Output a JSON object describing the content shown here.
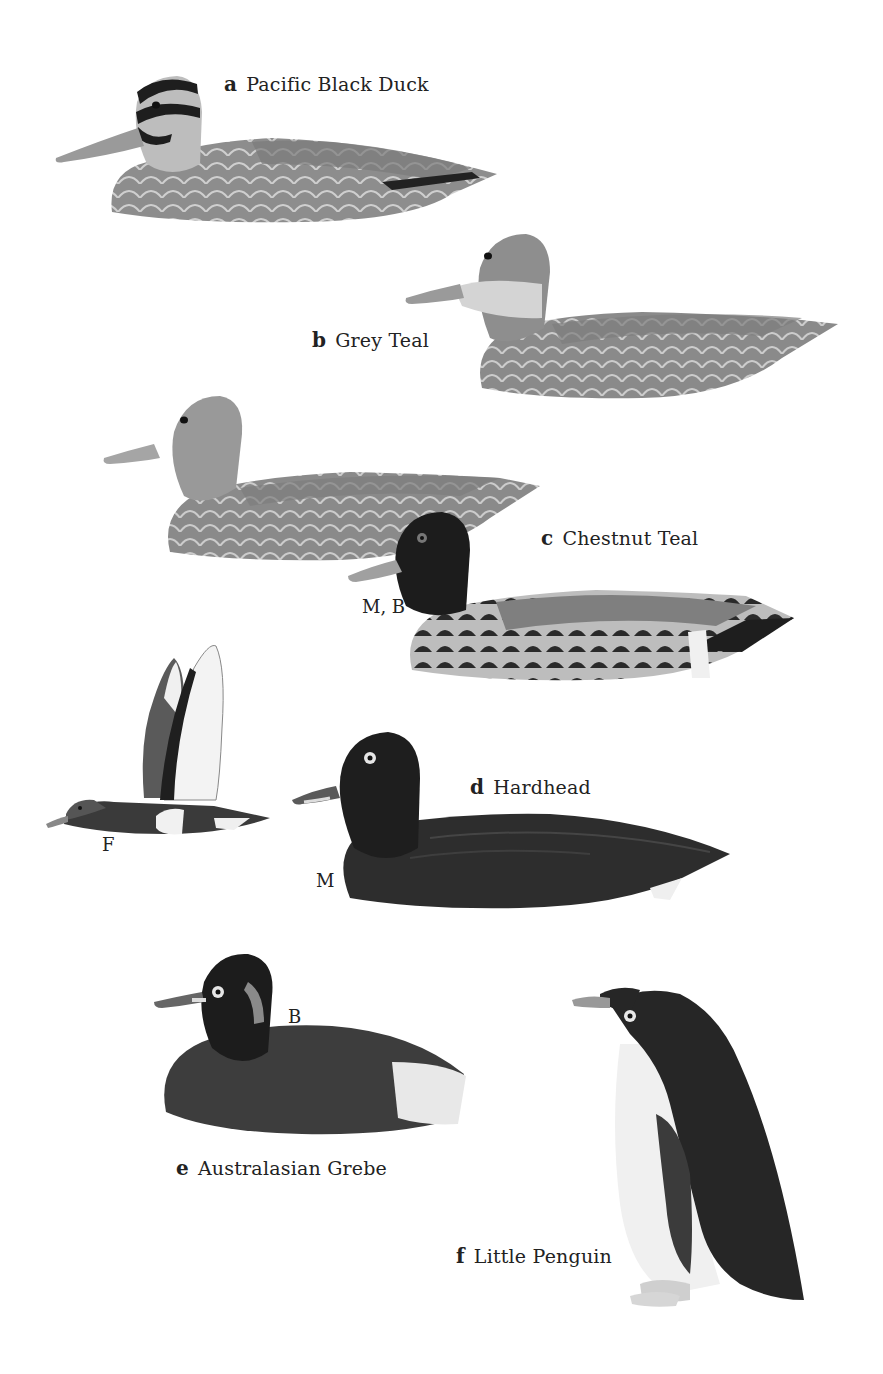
{
  "plate": {
    "species": [
      {
        "letter": "a",
        "name": "Pacific Black Duck"
      },
      {
        "letter": "b",
        "name": "Grey Teal"
      },
      {
        "letter": "c",
        "name": "Chestnut Teal"
      },
      {
        "letter": "d",
        "name": "Hardhead"
      },
      {
        "letter": "e",
        "name": "Australasian Grebe"
      },
      {
        "letter": "f",
        "name": "Little Penguin"
      }
    ],
    "tags": {
      "chestnut_teal_male": "M, B",
      "hardhead_female": "F",
      "hardhead_male": "M",
      "grebe_breeding": "B"
    },
    "colors": {
      "background": "#ffffff",
      "body_mid_grey": "#8a8a8a",
      "scallop_light": "#c9c9c9",
      "dark_plumage": "#2a2a2a",
      "white_patch": "#f2f2f2"
    }
  }
}
